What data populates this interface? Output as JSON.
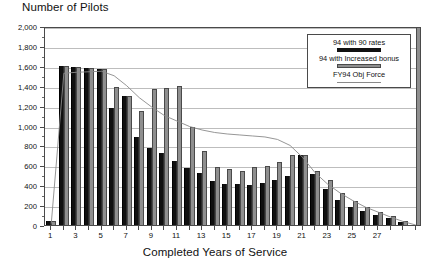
{
  "chart_data": {
    "type": "bar",
    "title": "Number of Pilots",
    "xlabel": "Completed Years of Service",
    "ylabel": "Number of Pilots",
    "ylim": [
      0,
      2000
    ],
    "ytick_step": 200,
    "grid": true,
    "legend_position": "top-right",
    "categories": [
      1,
      2,
      3,
      4,
      5,
      6,
      7,
      8,
      9,
      10,
      11,
      12,
      13,
      14,
      15,
      16,
      17,
      18,
      19,
      20,
      21,
      22,
      23,
      24,
      25,
      26,
      27,
      28,
      29,
      30
    ],
    "xtick_labels": [
      "1",
      "3",
      "5",
      "7",
      "9",
      "11",
      "13",
      "15",
      "17",
      "19",
      "21",
      "23",
      "25",
      "27"
    ],
    "ytick_labels": [
      "0",
      "200",
      "400",
      "600",
      "800",
      "1,000",
      "1,200",
      "1,400",
      "1,600",
      "1,800",
      "2,000"
    ],
    "series": [
      {
        "name": "94 with 90 rates",
        "color": "#101010",
        "values": [
          40,
          1600,
          1590,
          1575,
          1565,
          1175,
          1295,
          880,
          770,
          720,
          640,
          575,
          525,
          440,
          415,
          410,
          400,
          420,
          455,
          490,
          700,
          510,
          365,
          255,
          185,
          140,
          105,
          70,
          35,
          0
        ]
      },
      {
        "name": "94 with Increased bonus",
        "color": "#8f8f8f",
        "values": [
          40,
          1600,
          1590,
          1575,
          1565,
          1390,
          1300,
          1150,
          1365,
          1380,
          1395,
          990,
          745,
          580,
          560,
          545,
          580,
          595,
          635,
          700,
          700,
          545,
          455,
          325,
          240,
          185,
          130,
          90,
          45,
          1990
        ]
      },
      {
        "name": "FY94 Obj Force",
        "type": "line",
        "color": "#8a8a8a",
        "values": [
          35,
          1545,
          1555,
          1560,
          1565,
          1520,
          1420,
          1300,
          1205,
          1120,
          1065,
          1010,
          975,
          950,
          935,
          925,
          915,
          905,
          880,
          820,
          700,
          545,
          430,
          340,
          265,
          200,
          150,
          100,
          55,
          20
        ]
      }
    ],
    "legend_entries": [
      {
        "label": "94 with 90 rates",
        "swatch": "dark"
      },
      {
        "label": "94 with Increased bonus",
        "swatch": "light"
      },
      {
        "label": "FY94 Obj Force",
        "swatch": "line"
      }
    ]
  }
}
